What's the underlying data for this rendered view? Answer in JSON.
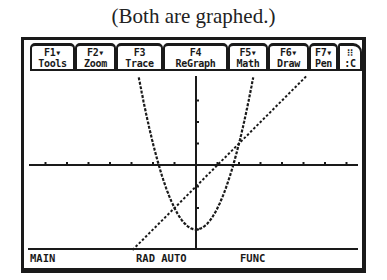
{
  "caption": "(Both are graphed.)",
  "toolbar": {
    "tabs": [
      {
        "key": "F1▾",
        "label": "Tools"
      },
      {
        "key": "F2▾",
        "label": "Zoom"
      },
      {
        "key": "F3",
        "label": "Trace"
      },
      {
        "key": "F4",
        "label": "ReGraph"
      },
      {
        "key": "F5▾",
        "label": "Math"
      },
      {
        "key": "F6▾",
        "label": "Draw"
      },
      {
        "key": "F7▾",
        "label": "Pen"
      },
      {
        "key": "⁝⁝",
        "label": ":C"
      }
    ]
  },
  "graph": {
    "functions": [
      {
        "name": "parabola",
        "expr": "y = x^2 - 3",
        "style": "dotted"
      },
      {
        "name": "line",
        "expr": "y = x - 1",
        "style": "dotted"
      }
    ],
    "intersections": [
      [
        -1,
        -2
      ],
      [
        2,
        1
      ]
    ],
    "x_ticks": [
      -7,
      -6,
      -5,
      -4,
      -3,
      -2,
      -1,
      1,
      2,
      3,
      4,
      5,
      6,
      7
    ],
    "y_ticks": [
      -3,
      -2,
      -1,
      1,
      2,
      3
    ]
  },
  "status": {
    "folder": "MAIN",
    "angle_mode": "RAD AUTO",
    "graph_mode": "FUNC"
  }
}
